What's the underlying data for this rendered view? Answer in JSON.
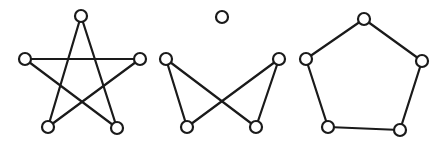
{
  "diagram": {
    "background": "#ffffff",
    "stroke_color": "#1a1a1a",
    "node_radius": 6,
    "graphs": [
      {
        "name": "pentagram-graph",
        "nodes": [
          {
            "id": "a",
            "x": 81,
            "y": 16
          },
          {
            "id": "b",
            "x": 25,
            "y": 59
          },
          {
            "id": "c",
            "x": 140,
            "y": 59
          },
          {
            "id": "d",
            "x": 48,
            "y": 127
          },
          {
            "id": "e",
            "x": 117,
            "y": 128
          }
        ],
        "edges": [
          [
            "a",
            "d"
          ],
          [
            "a",
            "e"
          ],
          [
            "b",
            "c"
          ],
          [
            "b",
            "e"
          ],
          [
            "c",
            "d"
          ]
        ]
      },
      {
        "name": "bowtie-graph-with-isolated-node",
        "nodes": [
          {
            "id": "a",
            "x": 222,
            "y": 17
          },
          {
            "id": "b",
            "x": 166,
            "y": 59
          },
          {
            "id": "c",
            "x": 279,
            "y": 59
          },
          {
            "id": "d",
            "x": 187,
            "y": 127
          },
          {
            "id": "e",
            "x": 256,
            "y": 127
          }
        ],
        "edges": [
          [
            "b",
            "d"
          ],
          [
            "b",
            "e"
          ],
          [
            "c",
            "d"
          ],
          [
            "c",
            "e"
          ]
        ]
      },
      {
        "name": "pentagon-cycle-graph",
        "nodes": [
          {
            "id": "a",
            "x": 364,
            "y": 19
          },
          {
            "id": "b",
            "x": 306,
            "y": 59
          },
          {
            "id": "c",
            "x": 422,
            "y": 61
          },
          {
            "id": "d",
            "x": 328,
            "y": 127
          },
          {
            "id": "e",
            "x": 400,
            "y": 130
          }
        ],
        "edges": [
          [
            "a",
            "b"
          ],
          [
            "a",
            "c"
          ],
          [
            "b",
            "d"
          ],
          [
            "c",
            "e"
          ],
          [
            "d",
            "e"
          ]
        ]
      }
    ]
  }
}
